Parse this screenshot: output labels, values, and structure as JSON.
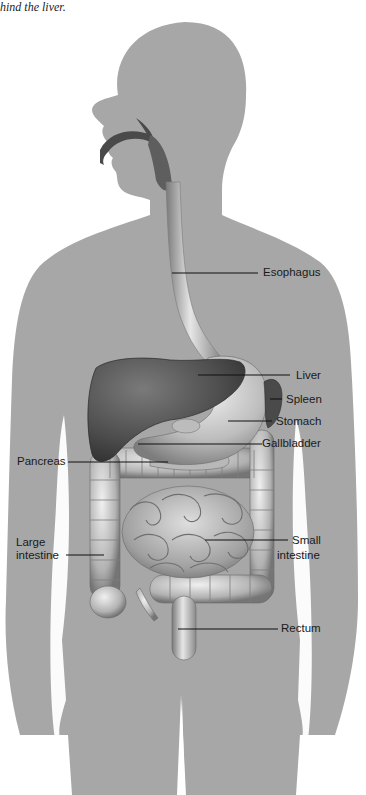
{
  "caption": "hind the liver.",
  "colors": {
    "background": "#ffffff",
    "silhouette": "#a7a7a7",
    "organ_dark": "#4a4a4a",
    "organ_mid": "#8e8e8e",
    "organ_light": "#d4d4d4",
    "leader_line": "#111111",
    "label_text": "#1a1a1a"
  },
  "labels": {
    "esophagus": "Esophagus",
    "liver": "Liver",
    "spleen": "Spleen",
    "stomach": "Stomach",
    "gallbladder": "Gallbladder",
    "pancreas": "Pancreas",
    "large_intestine_line1": "Large",
    "large_intestine_line2": "intestine",
    "small_intestine_line1": "Small",
    "small_intestine_line2": "intestine",
    "rectum": "Rectum"
  }
}
